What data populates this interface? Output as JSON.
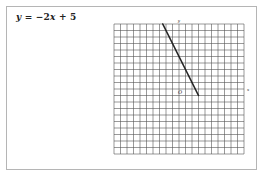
{
  "equation": {
    "lhs": "y",
    "eq": " = ",
    "minus": "−",
    "coef": "2",
    "var": "x",
    "rest": " + 5"
  },
  "axis_labels": {
    "x": "x",
    "y": "y",
    "origin": "O"
  },
  "colors": {
    "grid": "#555555",
    "line": "#222222",
    "frame": "#b5b5b5",
    "text": "#222222"
  },
  "chart_data": {
    "type": "line",
    "title": "y = −2x + 5",
    "xlabel": "x",
    "ylabel": "y",
    "xlim": [
      -10,
      10
    ],
    "ylim": [
      -10,
      10
    ],
    "grid": true,
    "grid_step": 1,
    "legend": null,
    "series": [
      {
        "name": "y = -2x + 5",
        "x": [
          -2.5,
          3
        ],
        "y": [
          10,
          -1
        ]
      }
    ]
  }
}
